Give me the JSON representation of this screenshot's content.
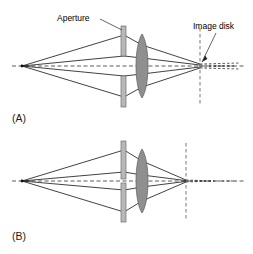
{
  "figure": {
    "background_color": "#ffffff",
    "width": 253,
    "height": 254
  },
  "annotations": {
    "aperture_label": "Aperture",
    "image_disk_label": "Image disk"
  },
  "panels": [
    {
      "id": "A",
      "label": "(A)",
      "aperture": "wide",
      "image_disk": "large"
    },
    {
      "id": "B",
      "label": "(B)",
      "aperture": "narrow",
      "image_disk": "small"
    }
  ],
  "colors": {
    "ray": "#111111",
    "axis": "#333333",
    "lens_fill": "#8f8f8f",
    "stop_fill": "#b8b8b8",
    "image_plane": "#555555",
    "text": "#000000"
  }
}
